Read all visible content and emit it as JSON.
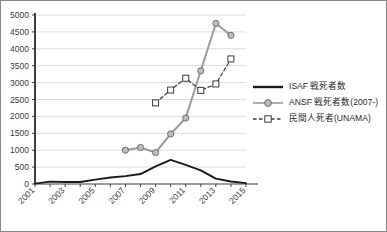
{
  "chart_data": {
    "type": "line",
    "title": "",
    "xlabel": "",
    "ylabel": "",
    "xlim": [
      2001,
      2015
    ],
    "ylim": [
      0,
      5000
    ],
    "y_ticks": [
      0,
      500,
      1000,
      1500,
      2000,
      2500,
      3000,
      3500,
      4000,
      4500,
      5000
    ],
    "y_tick_labels": [
      "0",
      "500",
      "1000",
      "1500",
      "2000",
      "2500",
      "3000",
      "3500",
      "4000",
      "4500",
      "5000"
    ],
    "x_ticks": [
      2001,
      2003,
      2005,
      2007,
      2009,
      2011,
      2013,
      2015
    ],
    "x_tick_labels": [
      "2001",
      "2003",
      "2005",
      "2007",
      "2009",
      "2011",
      "2013",
      "2015"
    ],
    "x_minor_ticks": [
      2002,
      2004,
      2006,
      2008,
      2010,
      2012,
      2014
    ],
    "grid": "horizontal",
    "legend_position": "right",
    "series": [
      {
        "name": "ISAF 戦死者数",
        "key": "isaf",
        "marker": "none",
        "linestyle": "solid",
        "color": "#1a1a1a",
        "x": [
          2001,
          2002,
          2003,
          2004,
          2005,
          2006,
          2007,
          2008,
          2009,
          2010,
          2011,
          2012,
          2013,
          2014,
          2015
        ],
        "values": [
          12,
          70,
          58,
          60,
          131,
          191,
          232,
          295,
          521,
          711,
          566,
          402,
          161,
          75,
          27
        ]
      },
      {
        "name": "ANSF 戦死者数(2007-)",
        "key": "ansf",
        "marker": "circle",
        "linestyle": "solid",
        "color": "#9a9a9a",
        "marker_fill": "#bdbdbd",
        "marker_edge": "#6e6e6e",
        "x": [
          2007,
          2008,
          2009,
          2010,
          2011,
          2012,
          2013,
          2014
        ],
        "values": [
          1000,
          1080,
          930,
          1480,
          1950,
          3350,
          4750,
          4400
        ]
      },
      {
        "name": "民間人死者(UNAMA)",
        "key": "unama",
        "marker": "square",
        "linestyle": "dashed",
        "color": "#3a3a3a",
        "marker_fill": "#ffffff",
        "marker_edge": "#3a3a3a",
        "x": [
          2009,
          2010,
          2011,
          2012,
          2013,
          2014
        ],
        "values": [
          2400,
          2780,
          3130,
          2770,
          2960,
          3700
        ]
      }
    ]
  },
  "legend": {
    "items": [
      {
        "label": "ISAF 戦死者数",
        "marker": "none"
      },
      {
        "label": "ANSF 戦死者数(2007-)",
        "marker": "circle"
      },
      {
        "label": "民間人死者(UNAMA)",
        "marker": "square"
      }
    ]
  },
  "colors": {
    "axis": "#3f3f3f",
    "grid": "#dcdcdc",
    "isaf": "#1a1a1a",
    "ansf": "#9a9a9a",
    "unama": "#3a3a3a",
    "frame": "#8a8a8a",
    "background": "#ffffff"
  }
}
